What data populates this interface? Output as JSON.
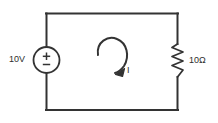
{
  "diagram": {
    "background_color": "#ffffff",
    "line_color": "#333333",
    "text_color": "#2e2e2e",
    "components": {
      "voltage_source": {
        "type": "dc-voltage-source",
        "label": "10V",
        "polarity_symbol": "±",
        "position": {
          "x": 46,
          "y": 60
        },
        "radius": 13
      },
      "resistor": {
        "type": "resistor",
        "label": "10Ω",
        "position": {
          "x": 178,
          "y": 60
        },
        "zigzag_segments": 7
      },
      "mesh_current": {
        "type": "mesh-current-loop",
        "label": "I",
        "direction": "clockwise",
        "position": {
          "x": 112,
          "y": 58
        }
      },
      "wires": {
        "left_x": 46,
        "right_x": 178,
        "top_y": 13,
        "bottom_y": 110
      }
    }
  }
}
